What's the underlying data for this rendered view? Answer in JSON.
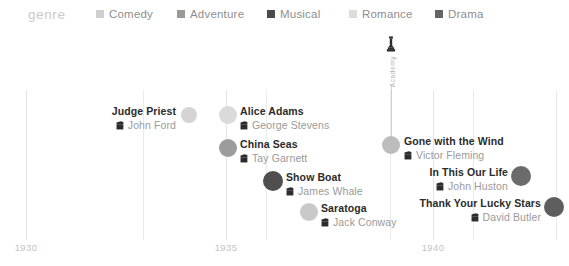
{
  "legend": {
    "title": "genre",
    "items": [
      {
        "label": "Comedy",
        "color": "#d0d0d0",
        "x": 96
      },
      {
        "label": "Adventure",
        "color": "#9a9a9a",
        "x": 177
      },
      {
        "label": "Musical",
        "color": "#4a4a4a",
        "x": 267
      },
      {
        "label": "Romance",
        "color": "#dcdcdc",
        "x": 349
      },
      {
        "label": "Drama",
        "color": "#646464",
        "x": 435
      }
    ]
  },
  "axis": {
    "ticks": [
      {
        "label": "1930",
        "x": 26
      },
      {
        "label": "1935",
        "x": 226
      },
      {
        "label": "1940",
        "x": 433
      }
    ],
    "gridlines": [
      {
        "x": 26,
        "major": true
      },
      {
        "x": 143,
        "major": false
      },
      {
        "x": 226,
        "major": true
      },
      {
        "x": 266,
        "major": false
      },
      {
        "x": 390,
        "major": false
      },
      {
        "x": 433,
        "major": true
      },
      {
        "x": 473,
        "major": false
      },
      {
        "x": 556,
        "major": false
      }
    ]
  },
  "annotation": {
    "icon_name": "oscar-statuette-icon",
    "text": "Academy",
    "x": 391,
    "icon_top": 2,
    "text_top": 22,
    "line_top": 52,
    "line_height": 56
  },
  "chart_data": {
    "type": "scatter",
    "title": "",
    "xlabel": "",
    "ylabel": "",
    "xlim": [
      1929.3,
      1942.6
    ],
    "grid": true,
    "legend_position": "top",
    "color_legend": "genre",
    "points": [
      {
        "title": "Judge Priest",
        "director": "John Ford",
        "genre": "Comedy",
        "color": "#d4d4d4",
        "x": 189,
        "y": 81,
        "r": 8,
        "label_side": "left",
        "label_x": 176,
        "label_y": 71
      },
      {
        "title": "Alice Adams",
        "director": "George Stevens",
        "genre": "Romance",
        "color": "#dadada",
        "x": 228,
        "y": 81,
        "r": 9,
        "label_side": "right",
        "label_x": 240,
        "label_y": 71
      },
      {
        "title": "China Seas",
        "director": "Tay Garnett",
        "genre": "Adventure",
        "color": "#9c9c9c",
        "x": 228,
        "y": 114,
        "r": 9,
        "label_side": "right",
        "label_x": 240,
        "label_y": 104
      },
      {
        "title": "Show Boat",
        "director": "James Whale",
        "genre": "Musical",
        "color": "#4f4f4f",
        "x": 273,
        "y": 147,
        "r": 10,
        "label_side": "right",
        "label_x": 286,
        "label_y": 137
      },
      {
        "title": "Saratoga",
        "director": "Jack Conway",
        "genre": "Comedy",
        "color": "#c9c9c9",
        "x": 309,
        "y": 178,
        "r": 9,
        "label_side": "right",
        "label_x": 321,
        "label_y": 168
      },
      {
        "title": "Gone with the Wind",
        "director": "Victor Fleming",
        "genre": "Romance",
        "color": "#bdbdbd",
        "x": 391,
        "y": 111,
        "r": 9,
        "label_side": "right",
        "label_x": 404,
        "label_y": 101
      },
      {
        "title": "In This Our Life",
        "director": "John Huston",
        "genre": "Drama",
        "color": "#6b6b6b",
        "x": 521,
        "y": 142,
        "r": 10,
        "label_side": "left",
        "label_x": 508,
        "label_y": 132
      },
      {
        "title": "Thank Your Lucky Stars",
        "director": "David Butler",
        "genre": "Musical",
        "color": "#5e5e5e",
        "x": 554,
        "y": 173,
        "r": 10,
        "label_side": "left",
        "label_x": 541,
        "label_y": 163
      }
    ]
  }
}
